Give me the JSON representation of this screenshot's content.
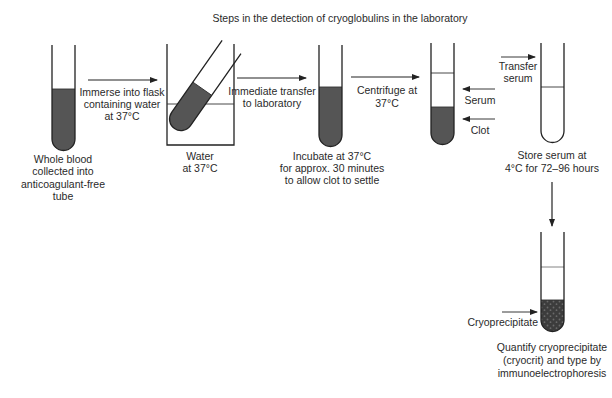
{
  "title": "Steps in the detection of cryoglobulins in the laboratory",
  "colors": {
    "blood": "#555555",
    "outline": "#222222",
    "text": "#2a2a2a",
    "background": "#ffffff"
  },
  "steps": [
    {
      "id": "whole-blood",
      "caption": [
        "Whole blood",
        "collected into",
        "anticoagulant-free",
        "tube"
      ]
    },
    {
      "id": "immerse-arrow",
      "label": [
        "Immerse into flask",
        "containing water",
        "at 37°C"
      ]
    },
    {
      "id": "water-flask",
      "caption": [
        "Water",
        "at 37°C"
      ]
    },
    {
      "id": "transfer-arrow",
      "label": [
        "Immediate transfer",
        "to laboratory"
      ]
    },
    {
      "id": "incubate",
      "caption": [
        "Incubate at 37°C",
        "for approx. 30 minutes",
        "to allow clot to settle"
      ]
    },
    {
      "id": "centrifuge-arrow",
      "label": [
        "Centrifuge at",
        "37°C"
      ]
    },
    {
      "id": "centrifuged-tube",
      "annotations": {
        "serum": "Serum",
        "clot": "Clot"
      }
    },
    {
      "id": "transfer-serum-arrow",
      "label": [
        "Transfer",
        "serum"
      ]
    },
    {
      "id": "store-serum",
      "caption": [
        "Store serum at",
        "4°C for 72–96 hours"
      ]
    },
    {
      "id": "cryoprecipitate-tube",
      "annotation": "Cryoprecipitate",
      "caption": [
        "Quantify cryoprecipitate",
        "(cryocrit) and type by",
        "immunoelectrophoresis"
      ]
    }
  ]
}
